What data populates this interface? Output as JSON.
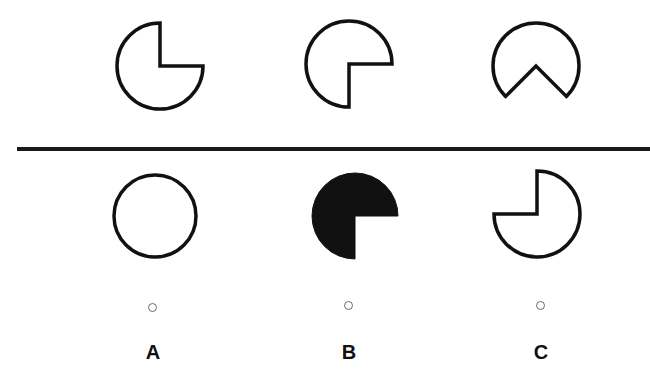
{
  "puzzle": {
    "top_row": [
      {
        "id": "top-1",
        "shape": "circle-missing-bottom-right-quadrant",
        "cx": 160,
        "cy": 66,
        "r": 43,
        "fill": "none"
      },
      {
        "id": "top-2",
        "shape": "circle-missing-bottom-right-quadrant-rotated",
        "cx": 349,
        "cy": 64,
        "r": 43,
        "fill": "none"
      },
      {
        "id": "top-3",
        "shape": "circle-missing-bottom-wedge",
        "cx": 536,
        "cy": 66,
        "r": 43,
        "fill": "none"
      }
    ],
    "options": [
      {
        "label": "A",
        "shape": "full-circle",
        "cx": 155,
        "cy": 216,
        "r": 42,
        "fill": "none",
        "radio": {
          "x": 153,
          "y": 308
        },
        "label_pos": {
          "x": 153,
          "y": 352
        }
      },
      {
        "label": "B",
        "shape": "circle-missing-bottom-right-quadrant",
        "cx": 355,
        "cy": 216,
        "r": 43,
        "fill": "#111111",
        "radio": {
          "x": 349,
          "y": 306
        },
        "label_pos": {
          "x": 349,
          "y": 352
        }
      },
      {
        "label": "C",
        "shape": "circle-missing-top-left-quadrant",
        "cx": 537,
        "cy": 214,
        "r": 43,
        "fill": "none",
        "radio": {
          "x": 541,
          "y": 306
        },
        "label_pos": {
          "x": 541,
          "y": 352
        }
      }
    ],
    "colors": {
      "stroke": "#111111",
      "fill_dark": "#111111",
      "background": "#ffffff",
      "radio_border": "#6a6a6a"
    }
  }
}
